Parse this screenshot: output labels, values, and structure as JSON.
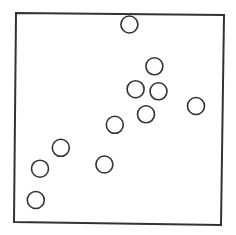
{
  "chart_data": {
    "type": "scatter",
    "title": "",
    "xlabel": "",
    "ylabel": "",
    "xlim": [
      0,
      100
    ],
    "ylim": [
      0,
      100
    ],
    "grid": false,
    "legend": null,
    "marker": "open-circle",
    "series": [
      {
        "name": "points",
        "points": [
          {
            "x": 55,
            "y": 95
          },
          {
            "x": 67,
            "y": 75
          },
          {
            "x": 58,
            "y": 64
          },
          {
            "x": 69,
            "y": 63
          },
          {
            "x": 87,
            "y": 56
          },
          {
            "x": 63,
            "y": 52
          },
          {
            "x": 48,
            "y": 47
          },
          {
            "x": 22,
            "y": 36
          },
          {
            "x": 12,
            "y": 26
          },
          {
            "x": 43,
            "y": 28
          },
          {
            "x": 10,
            "y": 11
          }
        ]
      }
    ],
    "colors": {
      "frame": "#333333",
      "marker_stroke": "#333333",
      "marker_fill": "#ffffff",
      "background": "#ffffff"
    }
  }
}
